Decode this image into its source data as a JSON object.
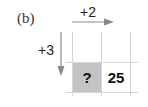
{
  "panel_label": "(b)",
  "arrows": {
    "horizontal": {
      "label": "+2",
      "direction": "right"
    },
    "vertical": {
      "label": "+3",
      "direction": "down"
    }
  },
  "cells": [
    {
      "value": "?",
      "shaded": true
    },
    {
      "value": "25",
      "shaded": false
    }
  ],
  "colors": {
    "shade": "#c4c4c4",
    "arrow": "#888888",
    "grid": "#d6d6d6"
  }
}
